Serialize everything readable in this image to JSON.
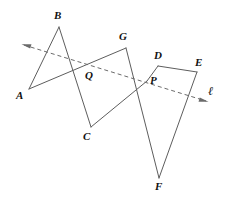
{
  "figure": {
    "background_color": "#ffffff",
    "stroke_color": "#5d5d5d",
    "axis_color": "#6b6b6b",
    "label_color": "#111111",
    "points": [
      {
        "id": "A",
        "label": "A",
        "x": 29,
        "y": 89,
        "label_x": 16,
        "label_y": 90
      },
      {
        "id": "B",
        "label": "B",
        "x": 59,
        "y": 27,
        "label_x": 54,
        "label_y": 10
      },
      {
        "id": "Q",
        "label": "Q",
        "x": 81,
        "y": 66,
        "label_x": 85,
        "label_y": 70
      },
      {
        "id": "C",
        "label": "C",
        "x": 91,
        "y": 127,
        "label_x": 83,
        "label_y": 131
      },
      {
        "id": "G",
        "label": "G",
        "x": 126,
        "y": 48,
        "label_x": 119,
        "label_y": 31
      },
      {
        "id": "P",
        "label": "P",
        "x": 147,
        "y": 81,
        "label_x": 150,
        "label_y": 75
      },
      {
        "id": "D",
        "label": "D",
        "x": 158,
        "y": 66,
        "label_x": 154,
        "label_y": 50
      },
      {
        "id": "E",
        "label": "E",
        "x": 197,
        "y": 72,
        "label_x": 195,
        "label_y": 57
      },
      {
        "id": "F",
        "label": "F",
        "x": 159,
        "y": 178,
        "label_x": 155,
        "label_y": 181
      }
    ],
    "segments": [
      {
        "name": "segment-AB",
        "from": "A",
        "to": "B"
      },
      {
        "name": "segment-B-to-C",
        "from": "B",
        "to": "C"
      },
      {
        "name": "segment-A-to-G",
        "from": "A",
        "to": "G"
      },
      {
        "name": "segment-G-to-F",
        "from": "G",
        "to": "F"
      },
      {
        "name": "segment-C-to-P",
        "from": "C",
        "to": "P"
      },
      {
        "name": "segment-P-D",
        "from": "P",
        "to": "D"
      },
      {
        "name": "segment-D-E",
        "from": "D",
        "to": "E"
      },
      {
        "name": "segment-E-F",
        "from": "E",
        "to": "F"
      }
    ],
    "line": {
      "id": "l",
      "label": "ℓ",
      "label_x": 208,
      "label_y": 85,
      "style": "dashed",
      "double_arrow": true,
      "start_x": 24,
      "start_y": 45,
      "end_x": 206,
      "end_y": 101
    }
  }
}
